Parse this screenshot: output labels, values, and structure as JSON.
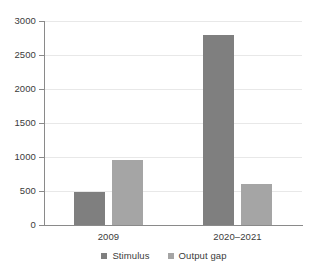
{
  "chart_data": {
    "type": "bar",
    "title": "",
    "subtitle": "",
    "xlabel": "",
    "ylabel": "",
    "categories": [
      "2009",
      "2020–2021"
    ],
    "series": [
      {
        "name": "Stimulus",
        "values": [
          485,
          2800
        ],
        "color": "#7f7f7f"
      },
      {
        "name": "Output gap",
        "values": [
          950,
          600
        ],
        "color": "#a5a5a5"
      }
    ],
    "ylim": [
      0,
      3000
    ],
    "yticks": [
      0,
      500,
      1000,
      1500,
      2000,
      2500,
      3000
    ],
    "ytick_labels": [
      "0",
      "500",
      "1000",
      "1500",
      "2000",
      "2500",
      "3000"
    ],
    "grid": true,
    "grid_axis": "y",
    "legend_position": "bottom",
    "annotations": []
  },
  "axes": {
    "y": {
      "ticks": [
        {
          "label": "3000",
          "value": 3000
        },
        {
          "label": "2500",
          "value": 2500
        },
        {
          "label": "2000",
          "value": 2000
        },
        {
          "label": "1500",
          "value": 1500
        },
        {
          "label": "1000",
          "value": 1000
        },
        {
          "label": "500",
          "value": 500
        },
        {
          "label": "0",
          "value": 0
        }
      ]
    },
    "x": {
      "ticks": [
        {
          "label": "2009"
        },
        {
          "label": "2020–2021"
        }
      ]
    }
  },
  "legend": {
    "items": [
      {
        "label": "Stimulus",
        "color": "#7f7f7f"
      },
      {
        "label": "Output gap",
        "color": "#a5a5a5"
      }
    ]
  },
  "colors": {
    "series_1": "#7f7f7f",
    "series_2": "#a5a5a5",
    "axis": "#8a8a8a",
    "grid": "#e8e8e8",
    "text": "#3b3b3b",
    "background": "#ffffff"
  }
}
